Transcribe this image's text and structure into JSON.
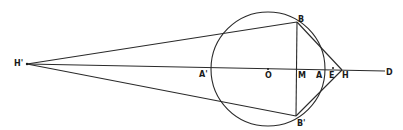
{
  "diagram": {
    "type": "geometric-construction",
    "colors": {
      "ink": "#2a2a2a",
      "background": "#ffffff"
    },
    "circle": {
      "center": "O",
      "cx": 268,
      "cy": 69,
      "r": 57
    },
    "points": {
      "H_prime": {
        "label": "H'",
        "x": 27,
        "y": 64
      },
      "A_prime": {
        "label": "A'",
        "x": 211,
        "y": 68
      },
      "O": {
        "label": "O",
        "x": 268,
        "y": 69
      },
      "M": {
        "label": "M",
        "x": 297,
        "y": 69
      },
      "A": {
        "label": "A",
        "x": 324,
        "y": 70
      },
      "E": {
        "label": "E",
        "x": 333,
        "y": 70
      },
      "H": {
        "label": "H",
        "x": 342,
        "y": 70
      },
      "D": {
        "label": "D",
        "x": 385,
        "y": 71
      },
      "B": {
        "label": "B",
        "x": 297,
        "y": 22
      },
      "B_prime": {
        "label": "B'",
        "x": 296,
        "y": 116
      }
    },
    "segments": [
      [
        "H_prime",
        "D"
      ],
      [
        "H_prime",
        "B"
      ],
      [
        "H_prime",
        "B_prime"
      ],
      [
        "B",
        "B_prime"
      ],
      [
        "B",
        "H"
      ],
      [
        "B_prime",
        "H"
      ]
    ]
  }
}
